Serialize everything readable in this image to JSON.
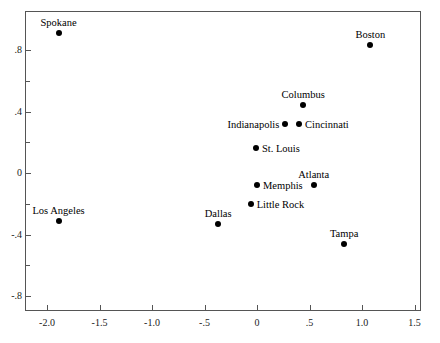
{
  "chart_data": {
    "type": "scatter",
    "title": "",
    "xlabel": "",
    "ylabel": "",
    "xlim": [
      -2.0,
      1.5
    ],
    "ylim": [
      -0.95,
      0.95
    ],
    "grid": false,
    "legend": "none",
    "x_ticks": [
      "-2.0",
      "-1.5",
      "-1.0",
      "-.5",
      "0",
      ".5",
      "1.0",
      "1.5"
    ],
    "x_tick_values": [
      -2.0,
      -1.5,
      -1.0,
      -0.5,
      0,
      0.5,
      1.0,
      1.5
    ],
    "y_ticks": [
      ".8",
      ".4",
      "0",
      "-.4",
      "-.8"
    ],
    "y_tick_values": [
      0.8,
      0.4,
      0,
      -0.4,
      -0.8
    ],
    "y_minor_tick_values": [
      0.6,
      0.2,
      -0.2,
      -0.6
    ],
    "points": [
      {
        "label": "Spokane",
        "x": -1.89,
        "y": 0.91,
        "label_pos": "above"
      },
      {
        "label": "Boston",
        "x": 1.08,
        "y": 0.83,
        "label_pos": "above"
      },
      {
        "label": "Columbus",
        "x": 0.44,
        "y": 0.44,
        "label_pos": "above"
      },
      {
        "label": "Indianapolis",
        "x": 0.27,
        "y": 0.32,
        "label_pos": "left"
      },
      {
        "label": "Cincinnati",
        "x": 0.4,
        "y": 0.32,
        "label_pos": "right"
      },
      {
        "label": "St. Louis",
        "x": -0.01,
        "y": 0.16,
        "label_pos": "right"
      },
      {
        "label": "Atlanta",
        "x": 0.54,
        "y": -0.08,
        "label_pos": "above"
      },
      {
        "label": "Memphis",
        "x": 0.0,
        "y": -0.08,
        "label_pos": "right"
      },
      {
        "label": "Little Rock",
        "x": -0.06,
        "y": -0.2,
        "label_pos": "right"
      },
      {
        "label": "Los Angeles",
        "x": -1.89,
        "y": -0.31,
        "label_pos": "above"
      },
      {
        "label": "Dallas",
        "x": -0.37,
        "y": -0.33,
        "label_pos": "above"
      },
      {
        "label": "Tampa",
        "x": 0.83,
        "y": -0.46,
        "label_pos": "above"
      }
    ]
  }
}
